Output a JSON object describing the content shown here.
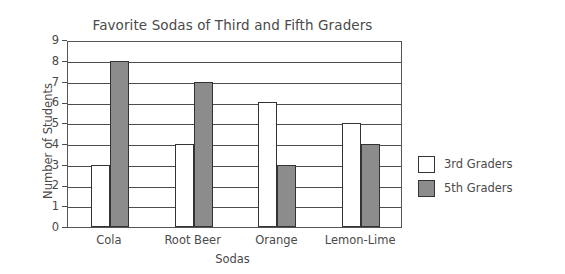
{
  "chart_data": {
    "type": "bar",
    "title": "Favorite Sodas of Third and Fifth Graders",
    "xlabel": "Sodas",
    "ylabel": "Number of Students",
    "categories": [
      "Cola",
      "Root Beer",
      "Orange",
      "Lemon-Lime"
    ],
    "series": [
      {
        "name": "3rd Graders",
        "values": [
          3,
          4,
          6,
          5
        ],
        "color": "#ffffff"
      },
      {
        "name": "5th Graders",
        "values": [
          8,
          7,
          3,
          4
        ],
        "color": "#8c8c8c"
      }
    ],
    "ylim": [
      0,
      9
    ],
    "ytick_labels": [
      "0",
      "1",
      "2",
      "3",
      "4",
      "5",
      "6",
      "7",
      "8",
      "9"
    ],
    "grid": true,
    "legend_position": "right"
  },
  "legend": {
    "entries": [
      {
        "label": "3rd Graders"
      },
      {
        "label": "5th Graders"
      }
    ]
  },
  "colors": {
    "third_graders": "#ffffff",
    "fifth_graders": "#8c8c8c",
    "axis": "#4d4d4d",
    "text": "#4a4a4a",
    "bar_outline": "#333333",
    "background": "#ffffff"
  }
}
